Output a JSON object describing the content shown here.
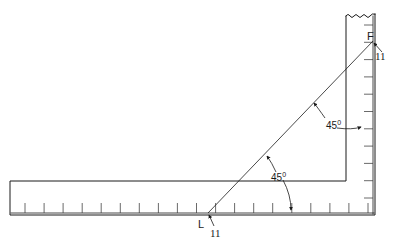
{
  "figure": {
    "type": "technical-diagram",
    "colors": {
      "ink": "#1a1a1a",
      "background": "#ffffff"
    }
  },
  "labels": {
    "point_f": "F",
    "point_f_callout": "11",
    "point_l": "L",
    "point_l_callout": "11",
    "angle_upper_value": "45",
    "angle_upper_unit": "0",
    "angle_lower_value": "45",
    "angle_lower_unit": "0"
  },
  "geometry": {
    "vertical_arm": {
      "x_left": 346,
      "x_right": 375,
      "y_top": 14,
      "y_inner_corner": 181
    },
    "horizontal_arm": {
      "x_left": 10,
      "y_top": 181,
      "y_bottom": 215
    },
    "diagonal": {
      "from": [
        208,
        213
      ],
      "to": [
        373,
        41
      ]
    },
    "bottom_tick_count": 19,
    "side_tick_count": 11
  }
}
